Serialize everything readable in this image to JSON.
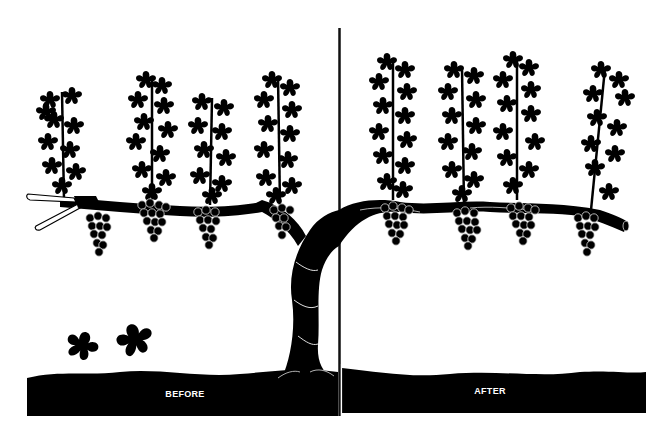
{
  "diagram": {
    "panels": [
      {
        "id": "before",
        "label": "BEFORE"
      },
      {
        "id": "after",
        "label": "AFTER"
      }
    ],
    "colors": {
      "ink": "#000000",
      "paper": "#ffffff",
      "highlight": "#d9d9d9"
    }
  },
  "before": {
    "label": "BEFORE",
    "shoots": [
      {
        "x": 62,
        "top": 88
      },
      {
        "x": 152,
        "top": 72
      },
      {
        "x": 212,
        "top": 95
      },
      {
        "x": 278,
        "top": 72
      }
    ],
    "clusters": [
      {
        "x": 98,
        "y": 218
      },
      {
        "x": 152,
        "y": 205
      },
      {
        "x": 208,
        "y": 212
      },
      {
        "x": 282,
        "y": 210
      }
    ],
    "fallen_leaves": [
      {
        "x": 82,
        "y": 346
      },
      {
        "x": 135,
        "y": 340
      }
    ],
    "tool": "pruning-shears"
  },
  "after": {
    "label": "AFTER",
    "shoots": [
      {
        "x": 393,
        "top": 58
      },
      {
        "x": 462,
        "top": 65
      },
      {
        "x": 517,
        "top": 55
      },
      {
        "x": 605,
        "top": 65
      }
    ],
    "clusters": [
      {
        "x": 395,
        "y": 208
      },
      {
        "x": 467,
        "y": 213
      },
      {
        "x": 521,
        "y": 208
      },
      {
        "x": 586,
        "y": 218
      }
    ]
  }
}
